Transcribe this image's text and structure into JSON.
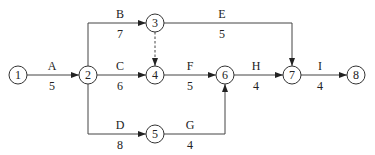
{
  "diagram": {
    "type": "activity-on-arrow network",
    "nodes": [
      {
        "id": "1",
        "label": "1",
        "x": 18,
        "y": 75
      },
      {
        "id": "2",
        "label": "2",
        "x": 88,
        "y": 75
      },
      {
        "id": "3",
        "label": "3",
        "x": 155,
        "y": 23
      },
      {
        "id": "4",
        "label": "4",
        "x": 155,
        "y": 75
      },
      {
        "id": "5",
        "label": "5",
        "x": 155,
        "y": 134
      },
      {
        "id": "6",
        "label": "6",
        "x": 225,
        "y": 75
      },
      {
        "id": "7",
        "label": "7",
        "x": 292,
        "y": 75
      },
      {
        "id": "8",
        "label": "8",
        "x": 356,
        "y": 75
      }
    ],
    "activities": [
      {
        "name": "A",
        "duration": "5",
        "from": "1",
        "to": "2"
      },
      {
        "name": "B",
        "duration": "7",
        "from": "2",
        "to": "3"
      },
      {
        "name": "C",
        "duration": "6",
        "from": "2",
        "to": "4"
      },
      {
        "name": "D",
        "duration": "8",
        "from": "2",
        "to": "5"
      },
      {
        "name": "E",
        "duration": "5",
        "from": "3",
        "to": "7"
      },
      {
        "name": "F",
        "duration": "5",
        "from": "4",
        "to": "6"
      },
      {
        "name": "G",
        "duration": "4",
        "from": "5",
        "to": "6"
      },
      {
        "name": "H",
        "duration": "4",
        "from": "6",
        "to": "7"
      },
      {
        "name": "I",
        "duration": "4",
        "from": "7",
        "to": "8"
      }
    ],
    "dummy_activities": [
      {
        "from": "3",
        "to": "4",
        "style": "dashed"
      }
    ]
  }
}
